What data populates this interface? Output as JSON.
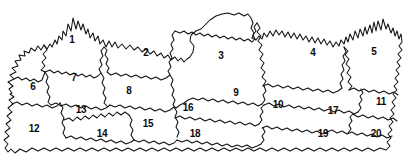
{
  "figure": {
    "kind": "hand-drawn numbered region map",
    "width": 407,
    "height": 165,
    "background_color": "#ffffff",
    "line_color": "#111111",
    "label_color": "#0a0a0a",
    "region_count": 20
  },
  "regions": [
    {
      "label": "1",
      "x": 72,
      "y": 40
    },
    {
      "label": "2",
      "x": 146,
      "y": 53
    },
    {
      "label": "3",
      "x": 221,
      "y": 56
    },
    {
      "label": "4",
      "x": 313,
      "y": 53
    },
    {
      "label": "5",
      "x": 374,
      "y": 52
    },
    {
      "label": "6",
      "x": 33,
      "y": 87
    },
    {
      "label": "7",
      "x": 74,
      "y": 78
    },
    {
      "label": "8",
      "x": 129,
      "y": 91
    },
    {
      "label": "9",
      "x": 236,
      "y": 93
    },
    {
      "label": "10",
      "x": 278,
      "y": 105
    },
    {
      "label": "11",
      "x": 381,
      "y": 102
    },
    {
      "label": "12",
      "x": 34,
      "y": 129
    },
    {
      "label": "13",
      "x": 81,
      "y": 110
    },
    {
      "label": "14",
      "x": 102,
      "y": 134
    },
    {
      "label": "15",
      "x": 148,
      "y": 124
    },
    {
      "label": "16",
      "x": 188,
      "y": 108
    },
    {
      "label": "17",
      "x": 333,
      "y": 111
    },
    {
      "label": "18",
      "x": 195,
      "y": 134
    },
    {
      "label": "19",
      "x": 323,
      "y": 134
    },
    {
      "label": "20",
      "x": 376,
      "y": 134
    }
  ]
}
